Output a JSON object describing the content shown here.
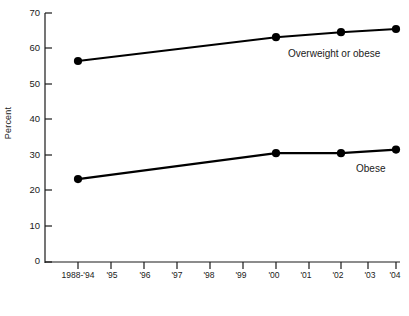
{
  "chart_data": {
    "type": "line",
    "title": "",
    "xlabel": "1994 through 2004",
    "ylabel": "Percent",
    "ylim": [
      0,
      70
    ],
    "ytick_labels": [
      "0",
      "10",
      "20",
      "30",
      "40",
      "50",
      "60",
      "70"
    ],
    "ytick_values": [
      0,
      10,
      20,
      30,
      40,
      50,
      60,
      70
    ],
    "grid": false,
    "legend_position": "inline-right",
    "categories": [
      "1988-'94",
      "'95",
      "'96",
      "'97",
      "'98",
      "'99",
      "'00",
      "'01",
      "'02",
      "'03",
      "'04"
    ],
    "series": [
      {
        "name": "Overweight or obese",
        "x": [
          "1988-'94",
          "'00",
          "'02",
          "'04"
        ],
        "values": [
          56.5,
          63.2,
          64.6,
          65.5
        ],
        "color": "#000000",
        "marker": "circle"
      },
      {
        "name": "Obese",
        "x": [
          "1988-'94",
          "'00",
          "'02",
          "'04"
        ],
        "values": [
          23.3,
          30.6,
          30.6,
          31.6
        ],
        "color": "#000000",
        "marker": "circle"
      }
    ],
    "annotations": [
      {
        "text": "Overweight or obese",
        "series": "Overweight or obese"
      },
      {
        "text": "Obese",
        "series": "Obese"
      }
    ]
  },
  "axis": {
    "y_label": "Percent",
    "x_label": "1994 through 2004",
    "y_ticks": [
      {
        "label": "70"
      },
      {
        "label": "60"
      },
      {
        "label": "50"
      },
      {
        "label": "40"
      },
      {
        "label": "30"
      },
      {
        "label": "20"
      },
      {
        "label": "10"
      },
      {
        "label": "0"
      }
    ],
    "x_ticks": [
      {
        "label": "1988-'94"
      },
      {
        "label": "'95"
      },
      {
        "label": "'96"
      },
      {
        "label": "'97"
      },
      {
        "label": "'98"
      },
      {
        "label": "'99"
      },
      {
        "label": "'00"
      },
      {
        "label": "'01"
      },
      {
        "label": "'02"
      },
      {
        "label": "'03"
      },
      {
        "label": "'04"
      }
    ]
  },
  "labels": {
    "overweight": "Overweight or obese",
    "obese": "Obese"
  }
}
